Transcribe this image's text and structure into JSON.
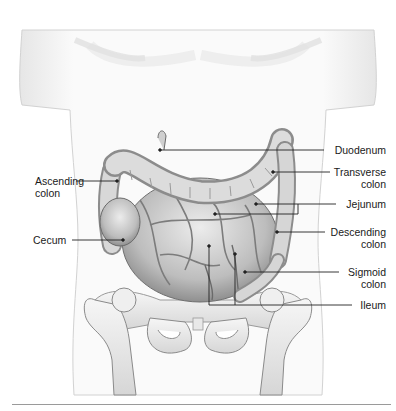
{
  "figure": {
    "labels_left": [
      {
        "id": "ascending-colon",
        "lines": [
          "Ascending",
          "colon"
        ]
      },
      {
        "id": "cecum",
        "lines": [
          "Cecum"
        ]
      }
    ],
    "labels_right": [
      {
        "id": "duodenum",
        "lines": [
          "Duodenum"
        ]
      },
      {
        "id": "transverse-colon",
        "lines": [
          "Transverse",
          "colon"
        ]
      },
      {
        "id": "jejunum",
        "lines": [
          "Jejunum"
        ]
      },
      {
        "id": "descending-colon",
        "lines": [
          "Descending",
          "colon"
        ]
      },
      {
        "id": "sigmoid-colon",
        "lines": [
          "Sigmoid",
          "colon"
        ]
      },
      {
        "id": "ileum",
        "lines": [
          "Ileum"
        ]
      }
    ]
  },
  "colors": {
    "skin_outline": "#c8c8c8",
    "organ_fill": "#d9d9d9",
    "organ_shadow": "#8c8c8c",
    "bone_fill": "#f1f1f1",
    "leader_line": "#222222",
    "rule": "#9a9a9a"
  }
}
